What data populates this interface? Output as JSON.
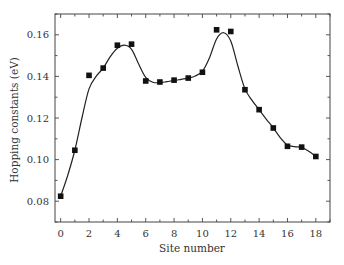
{
  "chart_data": {
    "type": "scatter",
    "title": "",
    "xlabel": "Site number",
    "ylabel": "Hopping constants (eV)",
    "xlim": [
      -0.4,
      19
    ],
    "ylim": [
      0.07,
      0.17
    ],
    "xticks": [
      0,
      2,
      4,
      6,
      8,
      10,
      12,
      14,
      16,
      18
    ],
    "xtick_labels": [
      "0",
      "2",
      "4",
      "6",
      "8",
      "10",
      "12",
      "14",
      "16",
      "18"
    ],
    "yticks": [
      0.08,
      0.1,
      0.12,
      0.14,
      0.16
    ],
    "ytick_labels": [
      "0.08",
      "0.10",
      "0.12",
      "0.14",
      "0.16"
    ],
    "x_minor_step": 1,
    "y_minor_step": 0.01,
    "grid": false,
    "legend": null,
    "series": [
      {
        "name": "Hopping constants",
        "marker": "square",
        "color": "#111111",
        "x": [
          0,
          1,
          2,
          3,
          4,
          5,
          6,
          7,
          8,
          9,
          10,
          11,
          12,
          13,
          14,
          15,
          16,
          17,
          18
        ],
        "values": [
          0.0824,
          0.1045,
          0.1405,
          0.144,
          0.155,
          0.1555,
          0.1378,
          0.1373,
          0.1382,
          0.1392,
          0.142,
          0.1624,
          0.1616,
          0.1336,
          0.124,
          0.1152,
          0.1064,
          0.106,
          0.1015
        ]
      },
      {
        "name": "Smooth fit",
        "type": "line",
        "color": "#222222",
        "x": [
          0,
          0.5,
          1,
          1.5,
          2,
          2.5,
          3,
          3.5,
          4,
          4.5,
          5,
          5.5,
          6,
          6.5,
          7,
          7.5,
          8,
          8.5,
          9,
          9.5,
          10,
          10.5,
          11,
          11.5,
          12,
          12.5,
          13,
          13.5,
          14,
          14.5,
          15,
          15.5,
          16,
          16.5,
          17,
          17.5,
          18
        ],
        "values": [
          0.0824,
          0.0925,
          0.1045,
          0.12,
          0.134,
          0.14,
          0.144,
          0.1495,
          0.1535,
          0.155,
          0.153,
          0.146,
          0.1395,
          0.1372,
          0.137,
          0.1375,
          0.138,
          0.1386,
          0.1392,
          0.1402,
          0.1425,
          0.149,
          0.158,
          0.161,
          0.157,
          0.145,
          0.134,
          0.1285,
          0.124,
          0.1195,
          0.1152,
          0.1105,
          0.107,
          0.1062,
          0.1058,
          0.104,
          0.1015
        ]
      }
    ]
  },
  "layout": {
    "plot": {
      "left": 55,
      "top": 14,
      "right": 330,
      "bottom": 222
    }
  }
}
